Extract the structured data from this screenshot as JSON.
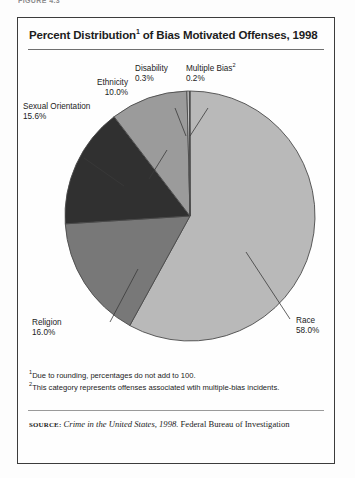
{
  "running_head": "FIGURE 4.3",
  "figure": {
    "title_main_a": "Percent Distribution",
    "title_sup": "1",
    "title_main_b": " of Bias Motivated Offenses, 1998"
  },
  "labels": {
    "ethnicity": {
      "name": "Ethnicity",
      "pct": "10.0%"
    },
    "disability": {
      "name": "Disability",
      "pct": "0.3%"
    },
    "multiple_bias": {
      "name": "Multiple Bias",
      "sup": "2",
      "pct": "0.2%"
    },
    "sexual_orientation": {
      "name": "Sexual Orientation",
      "pct": "15.6%"
    },
    "religion": {
      "name": "Religion",
      "pct": "16.0%"
    },
    "race": {
      "name": "Race",
      "pct": "58.0%"
    }
  },
  "notes": {
    "note1_sup": "1",
    "note1": "Due to rounding, percentages do not add to 100.",
    "note2_sup": "2",
    "note2": "This category represents offenses associated wtih multiple-bias incidents."
  },
  "source": {
    "label": "source:",
    "italic": "Crime in the United States, 1998.",
    "rest": " Federal Bureau of Investigation"
  },
  "chart_data": {
    "type": "pie",
    "categories": [
      "Race",
      "Religion",
      "Sexual Orientation",
      "Ethnicity",
      "Disability",
      "Multiple Bias"
    ],
    "values": [
      58.0,
      16.0,
      15.6,
      10.0,
      0.3,
      0.2
    ],
    "unit": "percent",
    "total": 100.1,
    "start_angle_deg": 0,
    "direction": "clockwise",
    "legend": "none",
    "labels_position": "external-with-leader-lines",
    "grid": false,
    "colors": [
      "#b9b9b9",
      "#787878",
      "#303030",
      "#9b9b9b",
      "#d0d0d0",
      "#8a8a8a"
    ],
    "slice_border": "#4a4a4a",
    "slices": [
      {
        "name": "Race",
        "value": 58.0,
        "color": "#b9b9b9",
        "start_deg": 0.0,
        "end_deg": 208.8
      },
      {
        "name": "Religion",
        "value": 16.0,
        "color": "#787878",
        "start_deg": 208.8,
        "end_deg": 266.4
      },
      {
        "name": "Sexual Orientation",
        "value": 15.6,
        "color": "#303030",
        "start_deg": 266.4,
        "end_deg": 322.6
      },
      {
        "name": "Ethnicity",
        "value": 10.0,
        "color": "#9b9b9b",
        "start_deg": 322.6,
        "end_deg": 358.6
      },
      {
        "name": "Disability",
        "value": 0.3,
        "color": "#d0d0d0",
        "start_deg": 358.6,
        "end_deg": 359.7
      },
      {
        "name": "Multiple Bias",
        "value": 0.2,
        "color": "#8a8a8a",
        "start_deg": 359.7,
        "end_deg": 360.0
      }
    ]
  }
}
